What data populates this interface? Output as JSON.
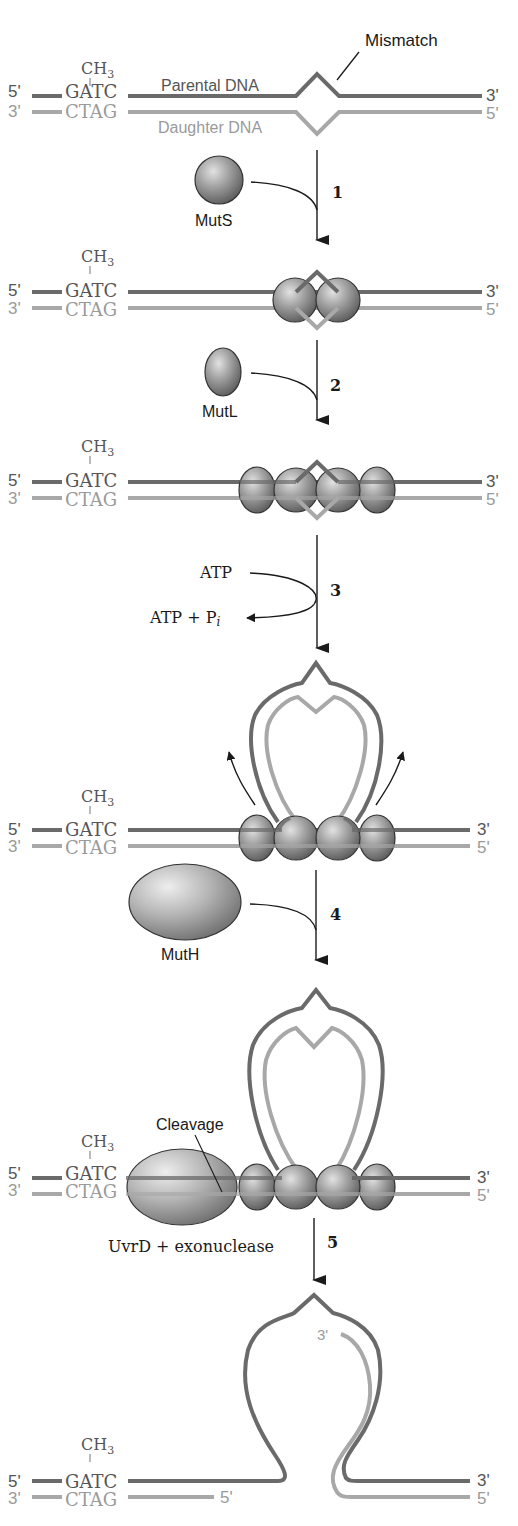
{
  "diagram": {
    "colors": {
      "parental_strand": "#6a6a6a",
      "daughter_strand": "#a8a8a8",
      "protein": "#8c8c8c",
      "arrow": "#1a1a1a"
    },
    "labels": {
      "mismatch": "Mismatch",
      "parental_dna": "Parental DNA",
      "daughter_dna": "Daughter DNA",
      "mutS": "MutS",
      "mutL": "MutL",
      "mutH": "MutH",
      "atp": "ATP",
      "atp_products": "ATP + P",
      "atp_products_sub": "i",
      "cleavage": "Cleavage",
      "uvrd": "UvrD + exonuclease",
      "ch3": "CH",
      "ch3_sub": "3",
      "gatc": "GATC",
      "ctag": "CTAG",
      "five_prime": "5'",
      "three_prime": "3'"
    },
    "steps": [
      {
        "number": "1",
        "reagent": "MutS"
      },
      {
        "number": "2",
        "reagent": "MutL"
      },
      {
        "number": "3",
        "reagent": "ATP",
        "product": "ATP + Pi"
      },
      {
        "number": "4",
        "reagent": "MutH"
      },
      {
        "number": "5",
        "reagent": "UvrD + exonuclease"
      }
    ],
    "stages": [
      {
        "id": "stage-0",
        "description": "Hemimethylated DNA with mismatch"
      },
      {
        "id": "stage-1",
        "description": "MutS bound at mismatch"
      },
      {
        "id": "stage-2",
        "description": "MutL joins MutS"
      },
      {
        "id": "stage-3",
        "description": "ATP-driven loop formation"
      },
      {
        "id": "stage-4",
        "description": "MutH cleaves unmethylated strand at GATC"
      },
      {
        "id": "stage-5",
        "description": "Daughter strand excised"
      }
    ]
  }
}
